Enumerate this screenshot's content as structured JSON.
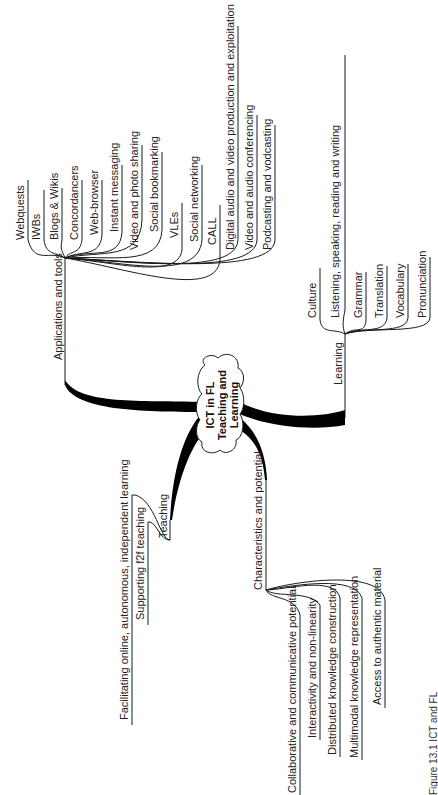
{
  "central_topic": {
    "line1": "ICT in FL",
    "line2": "Teaching and",
    "line3": "Learning"
  },
  "branches": {
    "applications": {
      "label": "Applications and tools",
      "items": [
        "Webquests",
        "IWBs",
        "Blogs & Wikis",
        "Concordancers",
        "Web-browser",
        "Instant messaging",
        "Video and photo sharing",
        "Social bookmarking",
        "VLEs",
        "Social networking",
        "CALL",
        "Digital audio and video production and exploitation",
        "Video and audio conferencing",
        "Podcasting and vodcasting"
      ]
    },
    "learning": {
      "label": "Learning",
      "items": [
        "Culture",
        "Listening, speaking, reading and writing",
        "Grammar",
        "Translation",
        "Vocabulary",
        "Pronunciation"
      ]
    },
    "teaching": {
      "label": "Teaching",
      "items": [
        "Facilitating online, autonomous, independent learning",
        "Supporting f2f teaching"
      ]
    },
    "characteristics": {
      "label": "Characteristics and potential",
      "items": [
        "Collaborative and communicative potential",
        "Interactivity and non-linearity",
        "Distributed knowledge construction",
        "Multimodal knowledge representation",
        "Access to authentic material"
      ]
    }
  },
  "caption": "Figure 13.1 ICT and FL"
}
